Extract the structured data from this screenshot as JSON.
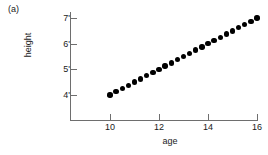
{
  "panel": {
    "label": "(a)"
  },
  "chart_data": {
    "type": "scatter",
    "title": "",
    "subtitle": "",
    "xlabel": "age",
    "ylabel": "height",
    "xlim": [
      9.0,
      16.6
    ],
    "ylim": [
      3.55,
      7.25
    ],
    "grid": false,
    "legend": null,
    "xticks": [
      10,
      12,
      14,
      16
    ],
    "xtick_labels": [
      "10",
      "12",
      "14",
      "16"
    ],
    "yticks": [
      4,
      5,
      6,
      7
    ],
    "ytick_labels": [
      "4'",
      "5'",
      "6'",
      "7'"
    ],
    "annotations": [
      "(a)"
    ],
    "marker": "filled-circle",
    "marker_color": "#000000",
    "axis_color": "#6e6e6e",
    "series": [
      {
        "name": "height vs age",
        "x": [
          10,
          10.25,
          10.5,
          10.75,
          11,
          11.25,
          11.5,
          11.75,
          12,
          12.25,
          12.5,
          12.75,
          13,
          13.25,
          13.5,
          13.75,
          14,
          14.25,
          14.5,
          14.75,
          15,
          15.25,
          15.5,
          15.75,
          16
        ],
        "y": [
          4,
          4.125,
          4.25,
          4.375,
          4.5,
          4.625,
          4.75,
          4.875,
          5,
          5.125,
          5.25,
          5.375,
          5.5,
          5.625,
          5.75,
          5.875,
          6,
          6.125,
          6.25,
          6.375,
          6.5,
          6.625,
          6.75,
          6.875,
          7
        ]
      }
    ]
  }
}
